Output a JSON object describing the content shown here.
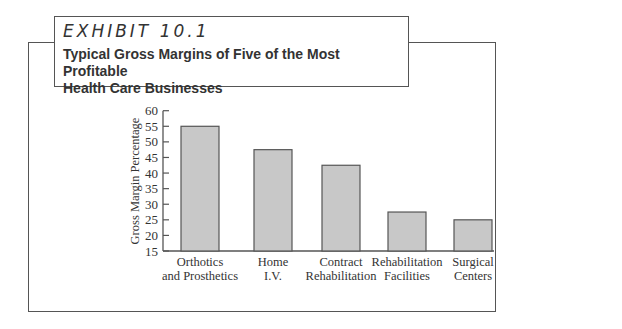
{
  "header": {
    "exhibit_label": "EXHIBIT 10.1",
    "title_line1": "Typical Gross Margins of Five of the Most Profitable",
    "title_line2": "Health Care Businesses"
  },
  "chart_data": {
    "type": "bar",
    "title": "Typical Gross Margins of Five of the Most Profitable Health Care Businesses",
    "xlabel": "",
    "ylabel": "Gross Margin Percentage",
    "ylim": [
      15,
      60
    ],
    "yticks": [
      15,
      20,
      25,
      30,
      35,
      40,
      45,
      50,
      55,
      60
    ],
    "grid": false,
    "legend": null,
    "categories": [
      "Orthotics and Prosthetics",
      "Home I.V.",
      "Contract Rehabilitation",
      "Rehabilitation Facilities",
      "Surgical Centers"
    ],
    "category_lines": [
      [
        "Orthotics",
        "and Prosthetics"
      ],
      [
        "Home",
        "I.V."
      ],
      [
        "Contract",
        "Rehabilitation"
      ],
      [
        "Rehabilitation",
        "Facilities"
      ],
      [
        "Surgical",
        "Centers"
      ]
    ],
    "values": [
      55,
      47.5,
      42.5,
      27.5,
      25
    ],
    "bar_color": "#c8c8c8",
    "bar_edge_color": "#555555"
  }
}
